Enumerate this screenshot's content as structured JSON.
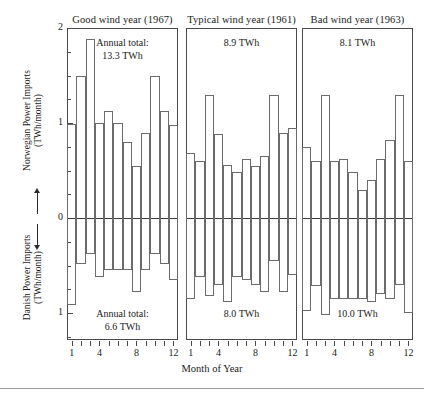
{
  "figure": {
    "xlabel": "Month of Year",
    "ylabel_top": "Norwegian Power Imports",
    "ylabel_top_unit": "(TWh/month)",
    "ylabel_bottom": "Danish Power Imports",
    "ylabel_bottom_unit": "(TWh/month)",
    "ytick_labels": [
      "2",
      "1",
      "0",
      "1"
    ],
    "xtick_labels": [
      "1",
      "4",
      "8",
      "12"
    ]
  },
  "chart_data": {
    "type": "bar",
    "title": "",
    "xlabel": "Month of Year",
    "ylabel": "Power Imports (TWh/month)",
    "ylim": [
      -1.25,
      2
    ],
    "grid": false,
    "legend": "none",
    "x": [
      1,
      2,
      3,
      4,
      5,
      6,
      7,
      8,
      9,
      10,
      11,
      12
    ],
    "panels": [
      {
        "title": "Good wind year (1967)",
        "annotation_top_line1": "Annual total:",
        "annotation_top_line2": "13.3 TWh",
        "annotation_bottom_line1": "Annual total:",
        "annotation_bottom_line2": "6.6 TWh",
        "norwegian_total_twh": 13.3,
        "danish_total_twh": 6.6,
        "series": [
          {
            "name": "Norwegian Power Imports",
            "direction": "up",
            "values": [
              0.99,
              1.5,
              1.88,
              1.0,
              1.13,
              1.0,
              0.8,
              0.55,
              0.9,
              1.5,
              1.13,
              0.98
            ]
          },
          {
            "name": "Danish Power Imports",
            "direction": "down",
            "values": [
              0.92,
              0.48,
              0.38,
              0.62,
              0.55,
              0.55,
              0.55,
              0.78,
              0.55,
              0.38,
              0.48,
              0.65
            ]
          }
        ]
      },
      {
        "title": "Typical wind year (1961)",
        "annotation_top_line1": "",
        "annotation_top_line2": "8.9 TWh",
        "annotation_bottom_line1": "",
        "annotation_bottom_line2": "8.0 TWh",
        "norwegian_total_twh": 8.9,
        "danish_total_twh": 8.0,
        "series": [
          {
            "name": "Norwegian Power Imports",
            "direction": "up",
            "values": [
              0.68,
              0.6,
              1.3,
              0.88,
              0.56,
              0.48,
              0.62,
              0.55,
              0.65,
              1.3,
              0.9,
              0.95
            ]
          },
          {
            "name": "Danish Power Imports",
            "direction": "down",
            "values": [
              0.85,
              0.62,
              0.82,
              0.7,
              0.88,
              0.62,
              0.65,
              0.7,
              0.78,
              0.45,
              0.78,
              0.6
            ]
          }
        ]
      },
      {
        "title": "Bad wind year (1963)",
        "annotation_top_line1": "",
        "annotation_top_line2": "8.1 TWh",
        "annotation_bottom_line1": "",
        "annotation_bottom_line2": "10.0 TWh",
        "norwegian_total_twh": 8.1,
        "danish_total_twh": 10.0,
        "series": [
          {
            "name": "Norwegian Power Imports",
            "direction": "up",
            "values": [
              0.75,
              0.6,
              1.3,
              0.6,
              0.62,
              0.48,
              0.3,
              0.4,
              0.62,
              0.82,
              1.3,
              0.6
            ]
          },
          {
            "name": "Danish Power Imports",
            "direction": "down",
            "values": [
              0.98,
              0.72,
              1.02,
              0.85,
              0.85,
              0.85,
              0.85,
              0.88,
              0.8,
              0.85,
              0.7,
              1.0
            ]
          }
        ]
      }
    ]
  }
}
